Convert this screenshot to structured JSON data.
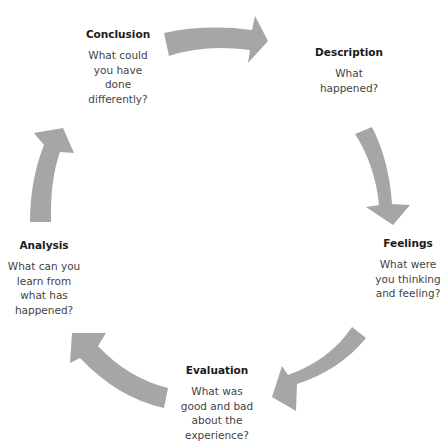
{
  "diagram": {
    "type": "cycle",
    "arrow_color": "#a6a6a6",
    "stages": [
      {
        "id": "description",
        "title": "Description",
        "lines": [
          "What",
          "happened?"
        ]
      },
      {
        "id": "feelings",
        "title": "Feelings",
        "lines": [
          "What were",
          "you thinking",
          "and feeling?"
        ]
      },
      {
        "id": "evaluation",
        "title": "Evaluation",
        "lines": [
          "What was",
          "good and bad",
          "about the",
          "experience?"
        ]
      },
      {
        "id": "analysis",
        "title": "Analysis",
        "lines": [
          "What can you",
          "learn from",
          "what has",
          "happened?"
        ]
      },
      {
        "id": "conclusion",
        "title": "Conclusion",
        "lines": [
          "What could",
          "you have",
          "done",
          "differently?"
        ]
      }
    ],
    "arrows": [
      {
        "from": "conclusion",
        "to": "description"
      },
      {
        "from": "description",
        "to": "feelings"
      },
      {
        "from": "feelings",
        "to": "evaluation"
      },
      {
        "from": "evaluation",
        "to": "analysis"
      },
      {
        "from": "analysis",
        "to": "conclusion"
      }
    ]
  }
}
